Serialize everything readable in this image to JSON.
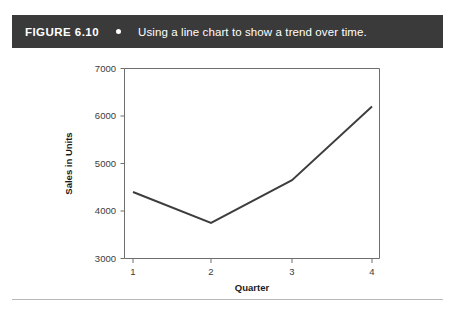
{
  "caption": {
    "figure_number": "FIGURE 6.10",
    "bullet_icon": "bullet-dot-icon",
    "text": "Using a line chart to show a trend over time.",
    "bar_color": "#3a3a3a",
    "text_color": "#ffffff"
  },
  "chart_data": {
    "type": "line",
    "title": "",
    "subtitle": "",
    "xlabel": "Quarter",
    "ylabel": "Sales in Units",
    "categories": [
      "1",
      "2",
      "3",
      "4"
    ],
    "x": [
      1,
      2,
      3,
      4
    ],
    "values": [
      4400,
      3750,
      4650,
      6200
    ],
    "series": [
      {
        "name": "Sales in Units",
        "values": [
          4400,
          3750,
          4650,
          6200
        ],
        "color": "#3d3d3d"
      }
    ],
    "xlim": [
      0.7,
      4.3
    ],
    "ylim": [
      3000,
      7000
    ],
    "ytick_labels": [
      "3000",
      "4000",
      "5000",
      "6000",
      "7000"
    ],
    "yticks": [
      3000,
      4000,
      5000,
      6000,
      7000
    ],
    "xtick_labels": [
      "1",
      "2",
      "3",
      "4"
    ],
    "xticks": [
      1,
      2,
      3,
      4
    ],
    "grid": false,
    "legend": false,
    "legend_position": "none",
    "axis_color": "#6e6e6e",
    "line_color": "#3d3d3d",
    "background": "#ffffff"
  },
  "footer": {
    "divider_color": "#b9b9b9"
  }
}
